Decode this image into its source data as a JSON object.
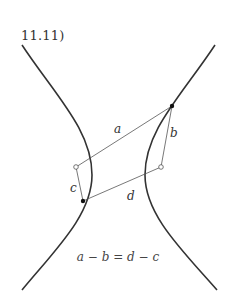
{
  "figure": {
    "number": "11.11)",
    "labels": {
      "a": "a",
      "b": "b",
      "c": "c",
      "d": "d"
    },
    "equation": "a − b = d − c",
    "colors": {
      "curve": "#333333",
      "segment": "#555555",
      "background": "#ffffff"
    }
  }
}
